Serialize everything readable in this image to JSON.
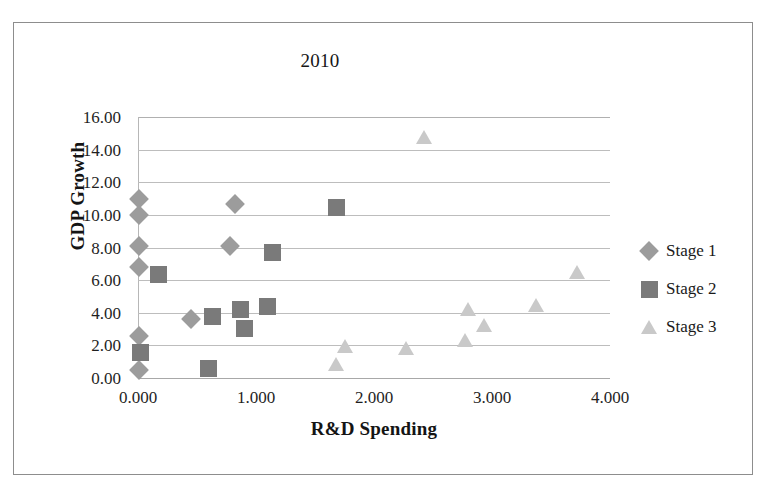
{
  "chart_data": {
    "type": "scatter",
    "title": "2010",
    "xlabel": "R&D Spending",
    "ylabel": "GDP Growth",
    "xlim": [
      0,
      4
    ],
    "ylim": [
      0,
      16
    ],
    "xticks": [
      "0.000",
      "1.000",
      "2.000",
      "3.000",
      "4.000"
    ],
    "xtick_values": [
      0,
      1,
      2,
      3,
      4
    ],
    "yticks": [
      "0.00",
      "2.00",
      "4.00",
      "6.00",
      "8.00",
      "10.00",
      "12.00",
      "14.00",
      "16.00"
    ],
    "ytick_values": [
      0,
      2,
      4,
      6,
      8,
      10,
      12,
      14,
      16
    ],
    "grid": "horizontal",
    "legend_position": "right",
    "series": [
      {
        "name": "Stage 1",
        "marker": "diamond",
        "color": "#9c9c9c",
        "points": [
          {
            "x": 0.01,
            "y": 11.0
          },
          {
            "x": 0.01,
            "y": 10.0
          },
          {
            "x": 0.01,
            "y": 8.1
          },
          {
            "x": 0.01,
            "y": 6.8
          },
          {
            "x": 0.01,
            "y": 2.6
          },
          {
            "x": 0.01,
            "y": 0.5
          },
          {
            "x": 0.45,
            "y": 3.6
          },
          {
            "x": 0.78,
            "y": 8.1
          },
          {
            "x": 0.82,
            "y": 10.65
          }
        ]
      },
      {
        "name": "Stage 2",
        "marker": "square",
        "color": "#7a7a7a",
        "points": [
          {
            "x": 0.02,
            "y": 1.55
          },
          {
            "x": 0.17,
            "y": 6.35
          },
          {
            "x": 0.6,
            "y": 0.6
          },
          {
            "x": 0.63,
            "y": 3.8
          },
          {
            "x": 0.87,
            "y": 4.2
          },
          {
            "x": 0.9,
            "y": 3.05
          },
          {
            "x": 1.1,
            "y": 4.4
          },
          {
            "x": 1.14,
            "y": 7.7
          },
          {
            "x": 1.68,
            "y": 10.45
          }
        ]
      },
      {
        "name": "Stage 3",
        "marker": "triangle",
        "color": "#c9c9c9",
        "points": [
          {
            "x": 1.68,
            "y": 0.85
          },
          {
            "x": 1.75,
            "y": 1.95
          },
          {
            "x": 2.27,
            "y": 1.85
          },
          {
            "x": 2.42,
            "y": 14.75
          },
          {
            "x": 2.77,
            "y": 2.35
          },
          {
            "x": 2.8,
            "y": 4.25
          },
          {
            "x": 2.93,
            "y": 3.25
          },
          {
            "x": 3.37,
            "y": 4.5
          },
          {
            "x": 3.72,
            "y": 6.5
          }
        ]
      }
    ]
  },
  "legend": {
    "items": [
      {
        "label": "Stage 1"
      },
      {
        "label": "Stage 2"
      },
      {
        "label": "Stage 3"
      }
    ]
  }
}
